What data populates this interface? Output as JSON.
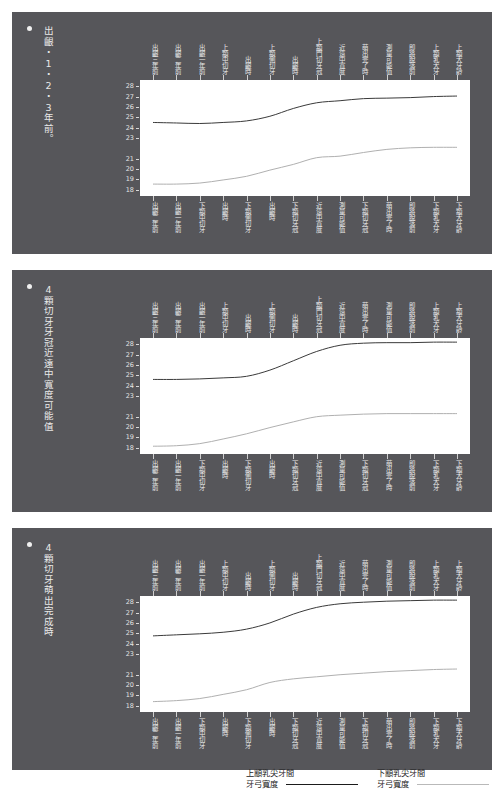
{
  "document": {
    "background": "#ffffff",
    "panel_color": "#56565a",
    "plot_background": "#ffffff"
  },
  "panels": [
    {
      "bullet": "●",
      "title": "出齦・1・2・3年前。"
    },
    {
      "bullet": "●",
      "title": "4顆切牙牙冠近遠中寬度可能值"
    },
    {
      "bullet": "●",
      "title": "4顆切牙萌出完成時"
    }
  ],
  "axes": {
    "y_ticks": [
      "28",
      "27",
      "26",
      "25",
      "24",
      "23",
      "21",
      "20",
      "19",
      "18"
    ],
    "y_min": 17.4,
    "y_max": 28.6,
    "x_labels_top": [
      "出齦三年前",
      "出齦二年前",
      "出齦一年前",
      "上顓中切牙",
      "出齦時",
      "上顓側切牙",
      "出齦時",
      "上顓門切牙冠",
      "近遠中寬度",
      "萌出完了時",
      "測量可能值",
      "即將脫落前",
      "上顓乳犬牙",
      "上顓犬牙齡"
    ],
    "x_labels_bottom": [
      "出齦二年前",
      "出齦一年前",
      "下顓中切牙",
      "出齦時",
      "下顓側切牙",
      "出齦時",
      "下顓切牙冠",
      "近遠中寬度",
      "測量可能值",
      "下顓切牙冠",
      "萌出完了時",
      "即將脫落前",
      "下顓乳犬牙",
      "下顓犬牙齡"
    ]
  },
  "legend": {
    "maxilla_line1": "上顓乳尖牙間",
    "maxilla_line2": "牙弓寬度",
    "mandible_line1": "下顓乳尖牙間",
    "mandible_line2": "牙弓寬度",
    "maxilla_color": "#1b1b1b",
    "mandible_color": "#b9b9b9"
  },
  "chart_data": {
    "type": "line",
    "xlabel": "",
    "ylabel": "",
    "ylim": [
      17.4,
      28.6
    ],
    "grid": false,
    "legend_position": "bottom",
    "x": [
      0,
      1,
      2,
      3,
      4,
      5,
      6,
      7,
      8,
      9,
      10,
      11,
      12,
      13
    ],
    "panels": [
      {
        "name": "出齦・1・2・3年前。",
        "series": [
          {
            "name": "上顓乳尖牙間牙弓寬度",
            "color": "#3a3a3a",
            "values": [
              24.5,
              24.45,
              24.4,
              24.5,
              24.65,
              25.1,
              25.85,
              26.4,
              26.6,
              26.8,
              26.85,
              26.9,
              27.0,
              27.05
            ]
          },
          {
            "name": "下顓乳尖牙間牙弓寬度",
            "color": "#b0b0b0",
            "values": [
              18.55,
              18.55,
              18.65,
              18.95,
              19.3,
              19.9,
              20.45,
              21.1,
              21.25,
              21.6,
              21.9,
              22.05,
              22.1,
              22.1
            ]
          }
        ]
      },
      {
        "name": "4顆切牙牙冠近遠中寬度可能值",
        "series": [
          {
            "name": "上顓乳尖牙間牙弓寬度",
            "color": "#3a3a3a",
            "values": [
              24.6,
              24.6,
              24.65,
              24.75,
              24.9,
              25.5,
              26.4,
              27.3,
              27.9,
              28.1,
              28.15,
              28.15,
              28.2,
              28.2
            ]
          },
          {
            "name": "下顓乳尖牙間牙弓寬度",
            "color": "#b0b0b0",
            "values": [
              18.15,
              18.2,
              18.4,
              18.85,
              19.35,
              19.95,
              20.5,
              21.0,
              21.15,
              21.25,
              21.3,
              21.3,
              21.3,
              21.3
            ]
          }
        ]
      },
      {
        "name": "4顆切牙萌出完成時",
        "series": [
          {
            "name": "上顓乳尖牙間牙弓寬度",
            "color": "#3a3a3a",
            "values": [
              24.75,
              24.85,
              24.95,
              25.1,
              25.4,
              26.0,
              26.85,
              27.5,
              27.85,
              28.0,
              28.1,
              28.15,
              28.2,
              28.2
            ]
          },
          {
            "name": "下顓乳尖牙間牙弓寬度",
            "color": "#b0b0b0",
            "values": [
              18.4,
              18.5,
              18.7,
              19.1,
              19.55,
              20.25,
              20.6,
              20.8,
              21.0,
              21.15,
              21.3,
              21.4,
              21.5,
              21.55
            ]
          }
        ]
      }
    ]
  }
}
